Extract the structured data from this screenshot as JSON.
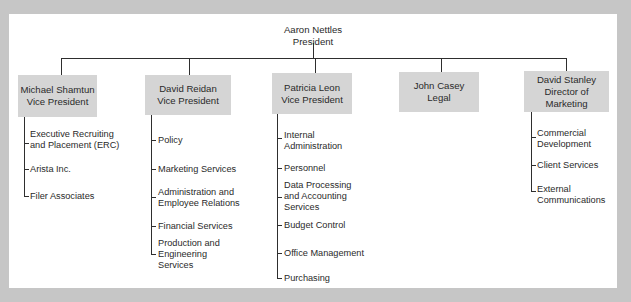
{
  "chart": {
    "president": {
      "name": "Aaron Nettles",
      "title": "President"
    },
    "departments": [
      {
        "name": "Michael Shamtun",
        "title": "Vice President",
        "children": [
          {
            "lines": [
              "Executive Recruiting",
              "and Placement (ERC)"
            ]
          },
          {
            "lines": [
              "Arista Inc."
            ]
          },
          {
            "lines": [
              "Filer Associates"
            ]
          }
        ]
      },
      {
        "name": "David Reidan",
        "title": "Vice President",
        "children": [
          {
            "lines": [
              "Policy"
            ]
          },
          {
            "lines": [
              "Marketing Services"
            ]
          },
          {
            "lines": [
              "Administration and",
              "Employee Relations"
            ]
          },
          {
            "lines": [
              "Financial Services"
            ]
          },
          {
            "lines": [
              "Production and",
              "Engineering",
              "Services"
            ]
          }
        ]
      },
      {
        "name": "Patricia Leon",
        "title": "Vice President",
        "children": [
          {
            "lines": [
              "Internal",
              "Administration"
            ]
          },
          {
            "lines": [
              "Personnel"
            ]
          },
          {
            "lines": [
              "Data Processing",
              "and Accounting",
              "Services"
            ]
          },
          {
            "lines": [
              "Budget Control"
            ]
          },
          {
            "lines": [
              "Office Management"
            ]
          },
          {
            "lines": [
              "Purchasing"
            ]
          }
        ]
      },
      {
        "name": "John Casey",
        "title": "Legal",
        "children": []
      },
      {
        "name": "David Stanley",
        "title": "Director of",
        "title2": "Marketing",
        "children": [
          {
            "lines": [
              "Commercial",
              "Development"
            ]
          },
          {
            "lines": [
              "Client Services"
            ]
          },
          {
            "lines": [
              "External",
              "Communications"
            ]
          }
        ]
      }
    ],
    "colors": {
      "background": "#c6c6c6",
      "panel": "#ffffff",
      "box": "#d5d5d5",
      "line": "#2e2e2e"
    }
  }
}
